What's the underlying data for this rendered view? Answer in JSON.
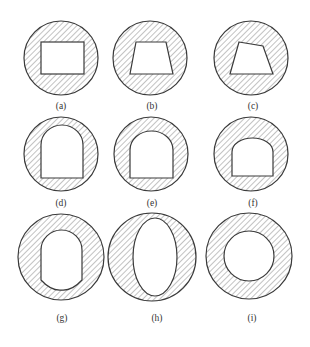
{
  "figure": {
    "colors": {
      "stroke": "#3a3a3a",
      "hatch": "#555555",
      "background": "#ffffff"
    },
    "panels": [
      {
        "id": "a",
        "label": "(a)",
        "opening": "rectangle"
      },
      {
        "id": "b",
        "label": "(b)",
        "opening": "trapezoid"
      },
      {
        "id": "c",
        "label": "(c)",
        "opening": "irregular-quadrilateral"
      },
      {
        "id": "d",
        "label": "(d)",
        "opening": "tall-arch"
      },
      {
        "id": "e",
        "label": "(e)",
        "opening": "arch"
      },
      {
        "id": "f",
        "label": "(f)",
        "opening": "flat-arch"
      },
      {
        "id": "g",
        "label": "(g)",
        "opening": "horseshoe-rounded"
      },
      {
        "id": "h",
        "label": "(h)",
        "opening": "vertical-ellipse"
      },
      {
        "id": "i",
        "label": "(i)",
        "opening": "circle"
      }
    ]
  }
}
